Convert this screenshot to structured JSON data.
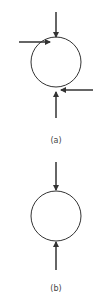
{
  "diagrams": [
    {
      "label": "(a)",
      "circle": {
        "cx": 56,
        "cy": 62,
        "r": 25
      },
      "arrows": [
        {
          "name": "top",
          "x1": 56,
          "y1": 12,
          "x2": 56,
          "y2": 37
        },
        {
          "name": "left",
          "x1": 19,
          "y1": 42,
          "x2": 50,
          "y2": 42
        },
        {
          "name": "right",
          "x1": 93,
          "y1": 90,
          "x2": 61,
          "y2": 90
        },
        {
          "name": "bottom",
          "x1": 56,
          "y1": 118,
          "x2": 56,
          "y2": 92
        }
      ]
    },
    {
      "label": "(b)",
      "circle": {
        "cx": 56,
        "cy": 216,
        "r": 25
      },
      "arrows": [
        {
          "name": "top",
          "x1": 56,
          "y1": 162,
          "x2": 56,
          "y2": 191
        },
        {
          "name": "bottom",
          "x1": 56,
          "y1": 270,
          "x2": 56,
          "y2": 242
        }
      ]
    }
  ],
  "colors": {
    "stroke": "#333333",
    "background": "#ffffff"
  }
}
